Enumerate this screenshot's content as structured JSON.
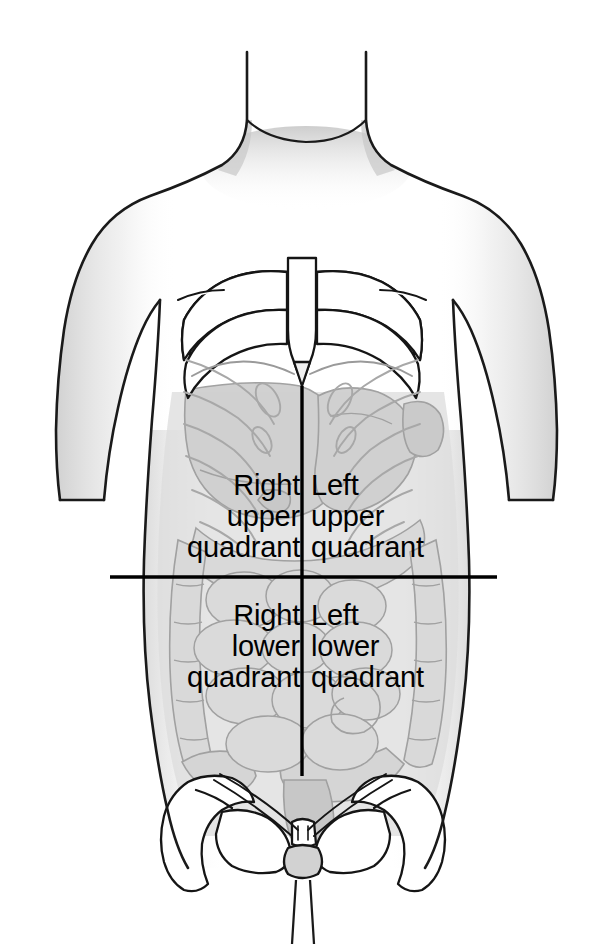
{
  "figure": {
    "colors": {
      "outline": "#1a1a1a",
      "organ_fill": "#dcdcdc",
      "organ_stroke": "#9a9a9a",
      "bone_fill": "#ffffff",
      "bone_stroke": "#111111",
      "shadow": "#cfcfcf",
      "divider": "#000000",
      "background": "#ffffff",
      "text": "#000000"
    },
    "dividers": {
      "vertical": {
        "x": 302,
        "y_top": 386,
        "y_bottom": 776
      },
      "horizontal": {
        "y": 577,
        "x_left": 110,
        "x_right": 497
      }
    }
  },
  "quadrants": [
    {
      "id": "right-upper",
      "lines": [
        "Right",
        "upper",
        "quadrant"
      ],
      "text": "Right\nupper\nquadrant",
      "align": "right"
    },
    {
      "id": "left-upper",
      "lines": [
        "Left",
        "upper",
        "quadrant"
      ],
      "text": "Left\nupper\nquadrant",
      "align": "left"
    },
    {
      "id": "right-lower",
      "lines": [
        "Right",
        "lower",
        "quadrant"
      ],
      "text": "Right\nlower\nquadrant",
      "align": "right"
    },
    {
      "id": "left-lower",
      "lines": [
        "Left",
        "lower",
        "quadrant"
      ],
      "text": "Left\nlower\nquadrant",
      "align": "left"
    }
  ],
  "anatomy": {
    "structures": [
      "neck",
      "shoulders",
      "left-arm",
      "right-arm",
      "rib-cage",
      "sternum",
      "xiphoid-process",
      "costal-margin",
      "liver",
      "stomach",
      "small-intestine",
      "ascending-colon",
      "transverse-colon",
      "descending-colon",
      "sigmoid-colon",
      "cecum",
      "pelvis",
      "ilium",
      "pubic-symphysis",
      "sacrum",
      "femur-heads",
      "thighs"
    ]
  }
}
